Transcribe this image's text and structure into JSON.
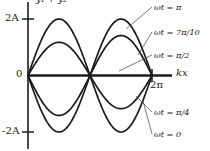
{
  "figure": {
    "top_label": "y₁ + y₂",
    "x_axis_label": "kx",
    "y_ticks": [
      {
        "label": "2A",
        "value": 2
      },
      {
        "label": "0",
        "value": 0
      },
      {
        "label": "-2A",
        "value": -2
      }
    ],
    "x_ticks": [
      {
        "label": "2π",
        "value": 6.2832
      }
    ],
    "curve_labels": [
      {
        "id": "wt-pi",
        "text": "ωt = π"
      },
      {
        "id": "wt-7pi10",
        "text": "ωt = 7π/10"
      },
      {
        "id": "wt-pi2",
        "text": "ωt = π/2"
      },
      {
        "id": "wt-pi4",
        "text": "ωt = π/4"
      },
      {
        "id": "wt-0",
        "text": "ωt = 0"
      }
    ],
    "stroke_color": "#1c1c1c",
    "background_color": "#fdfdfc"
  },
  "chart_data": {
    "type": "line",
    "title": "y₁ + y₂",
    "xlabel": "kx",
    "ylabel": "y₁ + y₂",
    "xlim": [
      0,
      6.2832
    ],
    "ylim": [
      -2,
      2
    ],
    "grid": false,
    "legend": "right-annotations",
    "x": [
      0,
      0.3927,
      0.7854,
      1.1781,
      1.5708,
      1.9635,
      2.3562,
      2.7489,
      3.1416,
      3.5343,
      3.927,
      4.3197,
      4.7124,
      5.1051,
      5.4978,
      5.8905,
      6.2832
    ],
    "series": [
      {
        "name": "ωt = 0",
        "amplitude": -2.0,
        "values": [
          0,
          -0.7654,
          -1.4142,
          -1.8478,
          -2.0,
          -1.8478,
          -1.4142,
          -0.7654,
          0,
          0.7654,
          1.4142,
          1.8478,
          2.0,
          1.8478,
          1.4142,
          0.7654,
          0
        ]
      },
      {
        "name": "ωt = π/4",
        "amplitude": -1.4142,
        "values": [
          0,
          -0.5412,
          -1.0,
          -1.3066,
          -1.4142,
          -1.3066,
          -1.0,
          -0.5412,
          0,
          0.5412,
          1.0,
          1.3066,
          1.4142,
          1.3066,
          1.0,
          0.5412,
          0
        ]
      },
      {
        "name": "ωt = π/2",
        "amplitude": 0.0,
        "values": [
          0,
          0,
          0,
          0,
          0,
          0,
          0,
          0,
          0,
          0,
          0,
          0,
          0,
          0,
          0,
          0,
          0
        ]
      },
      {
        "name": "ωt = 7π/10",
        "amplitude": 1.1756,
        "values": [
          0,
          0.4499,
          0.8313,
          1.0862,
          1.1756,
          1.0862,
          0.8313,
          0.4499,
          0,
          -0.4499,
          -0.8313,
          -1.0862,
          -1.1756,
          -1.0862,
          -0.8313,
          -0.4499,
          0
        ]
      },
      {
        "name": "ωt = π",
        "amplitude": 2.0,
        "values": [
          0,
          0.7654,
          1.4142,
          1.8478,
          2.0,
          1.8478,
          1.4142,
          0.7654,
          0,
          -0.7654,
          -1.4142,
          -1.8478,
          -2.0,
          -1.8478,
          -1.4142,
          -0.7654,
          0
        ]
      }
    ]
  }
}
